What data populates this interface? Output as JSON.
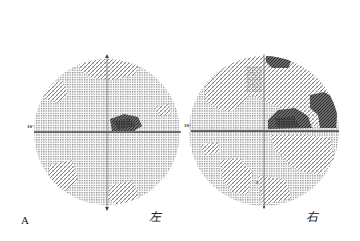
{
  "figure": {
    "panel_label": "A",
    "eyes": [
      {
        "label": "左",
        "meaning": "left eye",
        "axis_label": "10°"
      },
      {
        "label": "右",
        "meaning": "right eye",
        "axis_label": "10°"
      }
    ]
  },
  "colors": {
    "background": "#ffffff",
    "grid_dots": "#8c8c8c",
    "hatch": "#9a9a9a",
    "dark_defect": "#4a4a4a",
    "axis": "#555555"
  }
}
